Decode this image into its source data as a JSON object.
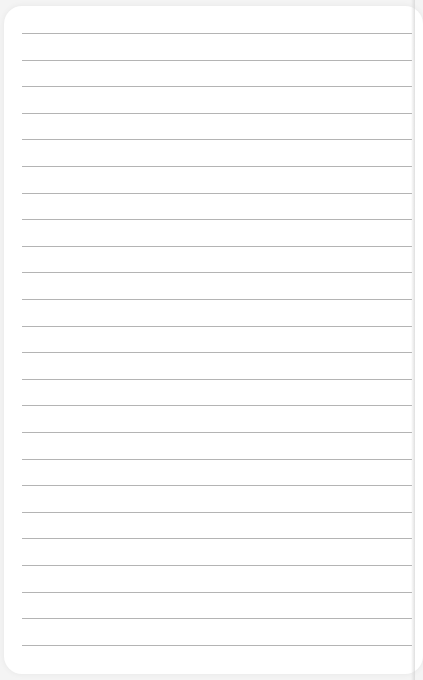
{
  "notepad": {
    "line_count": 24,
    "first_line_y": 33,
    "line_spacing": 26.6,
    "line_color": "#b4b4b4",
    "background": "#ffffff",
    "content": []
  }
}
